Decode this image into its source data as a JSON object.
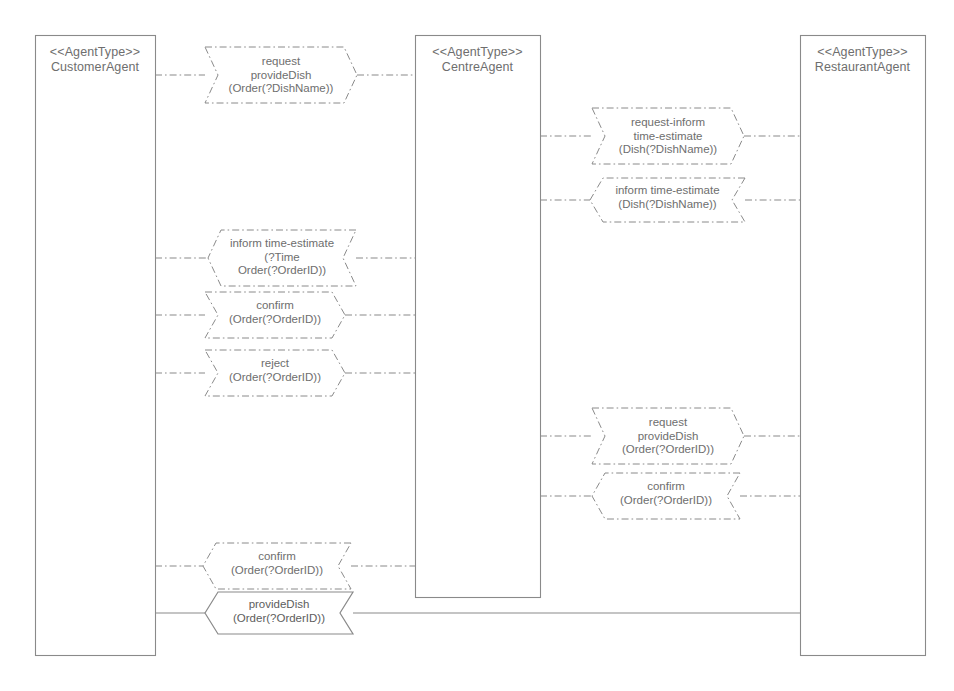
{
  "diagram": {
    "stereotype": "<<AgentType>>",
    "ink_color": "#8a8a8a",
    "text_color": "#6e6e6e",
    "background_color": "#ffffff"
  },
  "agents": [
    {
      "id": "customer",
      "stereotype": "<<AgentType>>",
      "name": "CustomerAgent",
      "x": 35,
      "y": 35,
      "w": 120,
      "h": 620
    },
    {
      "id": "centre",
      "stereotype": "<<AgentType>>",
      "name": "CentreAgent",
      "x": 415,
      "y": 35,
      "w": 125,
      "h": 562
    },
    {
      "id": "restaurant",
      "stereotype": "<<AgentType>>",
      "name": "RestaurantAgent",
      "x": 800,
      "y": 35,
      "w": 125,
      "h": 620
    }
  ],
  "messages": [
    {
      "id": "m1",
      "lines": [
        "request",
        "provideDish",
        "(Order(?DishName))"
      ],
      "from": "customer",
      "to": "centre",
      "direction": "right",
      "style": "dashdot",
      "box": {
        "x": 205,
        "y": 47,
        "w": 152,
        "h": 56
      },
      "label": {
        "x": 205,
        "y": 55
      }
    },
    {
      "id": "m2",
      "lines": [
        "request-inform",
        "time-estimate",
        "(Dish(?DishName))"
      ],
      "from": "centre",
      "to": "restaurant",
      "direction": "right",
      "style": "dashdot",
      "box": {
        "x": 592,
        "y": 108,
        "w": 152,
        "h": 56
      },
      "label": {
        "x": 592,
        "y": 116
      }
    },
    {
      "id": "m3",
      "lines": [
        "inform time-estimate",
        "(Dish(?DishName))"
      ],
      "from": "restaurant",
      "to": "centre",
      "direction": "left",
      "style": "dashdot",
      "box": {
        "x": 590,
        "y": 178,
        "w": 155,
        "h": 44
      },
      "label": {
        "x": 590,
        "y": 184
      }
    },
    {
      "id": "m4",
      "lines": [
        "inform time-estimate",
        "(?Time",
        "Order(?OrderID))"
      ],
      "from": "centre",
      "to": "customer",
      "direction": "left",
      "style": "dashdot",
      "box": {
        "x": 208,
        "y": 230,
        "w": 148,
        "h": 56
      },
      "label": {
        "x": 208,
        "y": 237
      }
    },
    {
      "id": "m5",
      "lines": [
        "confirm",
        "(Order(?OrderID))"
      ],
      "from": "customer",
      "to": "centre",
      "direction": "right",
      "style": "dashdot",
      "box": {
        "x": 205,
        "y": 292,
        "w": 140,
        "h": 46
      },
      "label": {
        "x": 205,
        "y": 299
      }
    },
    {
      "id": "m6",
      "lines": [
        "reject",
        "(Order(?OrderID))"
      ],
      "from": "customer",
      "to": "centre",
      "direction": "right",
      "style": "dashdot",
      "box": {
        "x": 205,
        "y": 350,
        "w": 140,
        "h": 46
      },
      "label": {
        "x": 205,
        "y": 357
      }
    },
    {
      "id": "m7",
      "lines": [
        "request",
        "provideDish",
        "(Order(?OrderID))"
      ],
      "from": "centre",
      "to": "restaurant",
      "direction": "right",
      "style": "dashdot",
      "box": {
        "x": 592,
        "y": 408,
        "w": 152,
        "h": 56
      },
      "label": {
        "x": 592,
        "y": 416
      }
    },
    {
      "id": "m8",
      "lines": [
        "confirm",
        "(Order(?OrderID))"
      ],
      "from": "restaurant",
      "to": "centre",
      "direction": "left",
      "style": "dashdot",
      "box": {
        "x": 592,
        "y": 473,
        "w": 148,
        "h": 46
      },
      "label": {
        "x": 592,
        "y": 480
      }
    },
    {
      "id": "m9",
      "lines": [
        "confirm",
        "(Order(?OrderID))"
      ],
      "from": "centre",
      "to": "customer",
      "direction": "left",
      "style": "dashdot",
      "box": {
        "x": 203,
        "y": 543,
        "w": 148,
        "h": 46
      },
      "label": {
        "x": 203,
        "y": 550
      }
    },
    {
      "id": "m10",
      "lines": [
        "provideDish",
        "(Order(?OrderID))"
      ],
      "from": "restaurant",
      "to": "customer",
      "direction": "left",
      "style": "solid",
      "box": {
        "x": 205,
        "y": 592,
        "w": 148,
        "h": 42
      },
      "label": {
        "x": 205,
        "y": 598
      }
    }
  ]
}
